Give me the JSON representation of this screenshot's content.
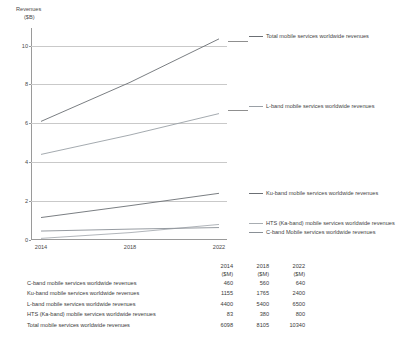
{
  "chart_data": {
    "type": "line",
    "title": "",
    "xlabel": "",
    "ylabel": "Revenues ($B)",
    "ylabel_line1": "Revenues",
    "ylabel_line2": "($B)",
    "x": [
      2014,
      2018,
      2022
    ],
    "xticklabels": [
      "2014",
      "2018",
      "2022"
    ],
    "yticklabels": [
      "0",
      "2",
      "4",
      "6",
      "8",
      "10"
    ],
    "yticks": [
      0,
      2,
      4,
      6,
      8,
      10
    ],
    "ylim": [
      0,
      10.9
    ],
    "grid": true,
    "legend_position": "right",
    "units_note": "Chart plotted in $B; table values in $M",
    "series": [
      {
        "name": "Total mobile services worldwide revenues",
        "values": [
          6.098,
          8.105,
          10.34
        ],
        "color": "#6b6f74"
      },
      {
        "name": "L-band mobile services worldwide revenues",
        "values": [
          4.4,
          5.4,
          6.5
        ],
        "color": "#9aa0a6"
      },
      {
        "name": "Ku-band mobile services worldwide revenues",
        "values": [
          1.155,
          1.765,
          2.4
        ],
        "color": "#6b6f74"
      },
      {
        "name": "HTS (Ka-band) mobile services worldwide revenues",
        "values": [
          0.083,
          0.38,
          0.8
        ],
        "color": "#a8adb2"
      },
      {
        "name": "C-band Mobile services worldwide revenues",
        "values": [
          0.46,
          0.56,
          0.64
        ],
        "color": "#8a9096"
      }
    ]
  },
  "legend": {
    "total": "Total mobile services worldwide revenues",
    "lband": "L-band mobile services worldwide revenues",
    "kuband": "Ku-band mobile services worldwide revenues",
    "hts": "HTS (Ka-band) mobile services worldwide revenues",
    "cband": "C-band Mobile services worldwide revenues"
  },
  "table": {
    "label_header": "",
    "columns": [
      {
        "year": "2014",
        "unit": "($M)"
      },
      {
        "year": "2018",
        "unit": "($M)"
      },
      {
        "year": "2022",
        "unit": "($M)"
      }
    ],
    "rows": [
      {
        "label": "C-band mobile services worldwide revenues",
        "v2014": "460",
        "v2018": "560",
        "v2022": "640"
      },
      {
        "label": "Ku-band mobile services worldwide revenues",
        "v2014": "1155",
        "v2018": "1765",
        "v2022": "2400"
      },
      {
        "label": "L-band mobile services worldwide revenues",
        "v2014": "4400",
        "v2018": "5400",
        "v2022": "6500"
      },
      {
        "label": "HTS (Ka-band) mobile services worldwide revenues",
        "v2014": "83",
        "v2018": "380",
        "v2022": "800"
      },
      {
        "label": "Total mobile services worldwide revenues",
        "v2014": "6098",
        "v2018": "8105",
        "v2022": "10340"
      }
    ]
  }
}
